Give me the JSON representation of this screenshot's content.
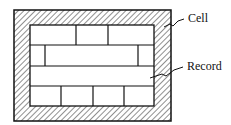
{
  "diagram": {
    "type": "block-layout",
    "labels": {
      "cell": "Cell",
      "record": "Record"
    },
    "outer_frame": {
      "x": 14,
      "y": 10,
      "w": 157,
      "h": 111,
      "fill": "hatched"
    },
    "inner_area": {
      "x": 30,
      "y": 25,
      "w": 124,
      "h": 81
    },
    "rows": [
      {
        "y0": 25,
        "y1": 45,
        "dividers_x": [
          76,
          108
        ]
      },
      {
        "y0": 45,
        "y1": 66,
        "dividers_x": [
          45,
          138
        ]
      },
      {
        "y0": 66,
        "y1": 86,
        "dividers_x": []
      },
      {
        "y0": 86,
        "y1": 106,
        "dividers_x": [
          61,
          93,
          124
        ]
      }
    ],
    "colors": {
      "stroke": "#111111",
      "background": "#ffffff"
    }
  }
}
